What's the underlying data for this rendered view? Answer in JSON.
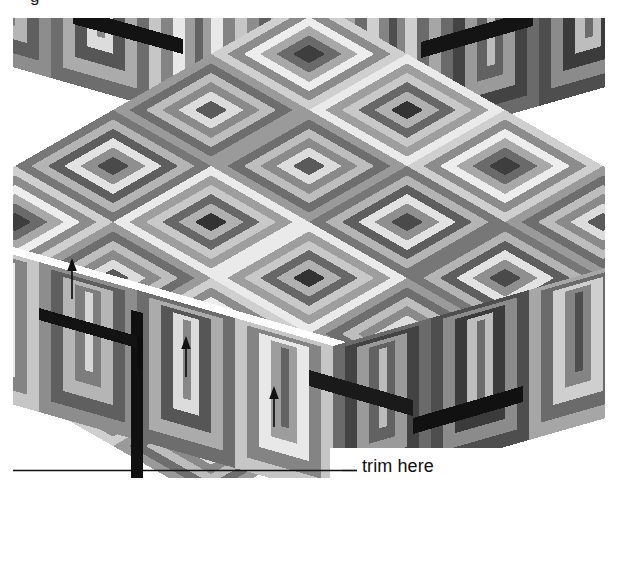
{
  "figure": {
    "kind": "isometric-pattern-illustration",
    "top_clipped_text": "g",
    "background_color": "#ffffff"
  },
  "annotations": {
    "trim_label": "trim here",
    "trim_line": {
      "x1": 13,
      "y1": 470,
      "x2": 342,
      "y2": 470,
      "color": "#101010",
      "width": 1.6
    },
    "leader_line": {
      "x1": 342,
      "y1": 470,
      "x2": 357,
      "y2": 470,
      "color": "#101010",
      "width": 1.6
    },
    "arrows": [
      {
        "name": "arrow-1",
        "x": 72,
        "y_tail": 299,
        "y_head": 261
      },
      {
        "name": "arrow-2",
        "x": 186,
        "y_tail": 377,
        "y_head": 339
      },
      {
        "name": "arrow-3",
        "x": 274,
        "y_tail": 427,
        "y_head": 389
      }
    ],
    "arrow_color": "#111111"
  },
  "palette": {
    "white": "#ffffff",
    "near_white": "#f2f2f2",
    "light_1": "#e6e6e6",
    "light_2": "#d2d2d2",
    "mid_1": "#bcbcbc",
    "mid_2": "#a4a4a4",
    "mid_3": "#8e8e8e",
    "dark_1": "#787878",
    "dark_2": "#616161",
    "dark_3": "#4b4b4b",
    "darker": "#363636",
    "near_black": "#1e1e1e",
    "black": "#0d0d0d"
  },
  "geometry": {
    "iso_cell_half_width": 49,
    "iso_cell_half_height": 28,
    "ring_count": 6,
    "top_rows": 7,
    "top_cols": 7,
    "front_face_height": 150
  }
}
